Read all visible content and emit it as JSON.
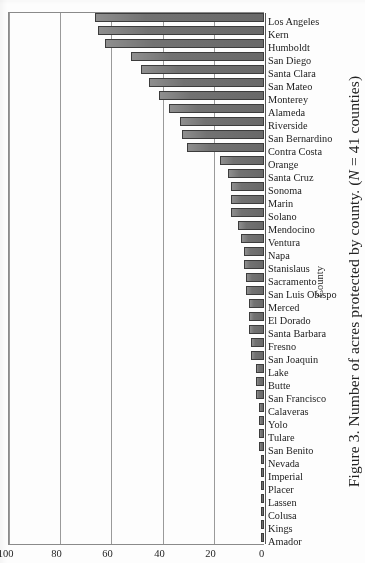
{
  "figure": {
    "caption_prefix": "Figure 3. Number of acres protected by county. (",
    "caption_n": "N",
    "caption_suffix": " = 41 counties)",
    "caption_full": "Figure 3. Number of acres protected by county. (N = 41 counties)"
  },
  "chart_data": {
    "type": "bar",
    "orientation": "horizontal",
    "title": "",
    "subtitle": "",
    "xlabel": "County",
    "ylabel": "",
    "ylim": [
      0,
      100
    ],
    "grid": true,
    "legend": "none",
    "tick_labels": [
      "0",
      "20",
      "40",
      "60",
      "80",
      "100"
    ],
    "tick_values": [
      0,
      20,
      40,
      60,
      80,
      100
    ],
    "categories": [
      "Amador",
      "Kings",
      "Colusa",
      "Lassen",
      "Placer",
      "Imperial",
      "Nevada",
      "San Benito",
      "Tulare",
      "Yolo",
      "Calaveras",
      "San Francisco",
      "Butte",
      "Lake",
      "San Joaquin",
      "Fresno",
      "Santa Barbara",
      "El Dorado",
      "Merced",
      "San Luis Obispo",
      "Sacramento",
      "Stanislaus",
      "Napa",
      "Ventura",
      "Mendocino",
      "Solano",
      "Marin",
      "Sonoma",
      "Santa Cruz",
      "Orange",
      "Contra Costa",
      "San Bernardino",
      "Riverside",
      "Alameda",
      "Monterey",
      "San Mateo",
      "Santa Clara",
      "San Diego",
      "Humboldt",
      "Kern",
      "Los Angeles"
    ],
    "values": [
      1,
      1,
      1,
      1,
      1,
      1,
      1,
      2,
      2,
      2,
      2,
      3,
      3,
      3,
      5,
      5,
      6,
      6,
      6,
      7,
      7,
      8,
      8,
      9,
      10,
      13,
      13,
      13,
      14,
      17,
      30,
      32,
      33,
      37,
      41,
      45,
      48,
      52,
      62,
      65,
      66
    ]
  }
}
